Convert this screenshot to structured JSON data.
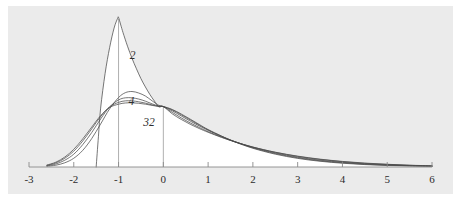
{
  "figure": {
    "background_color": "#ffffff",
    "panel_color": "#ebebeb",
    "fill_color": "#ffffff",
    "curve_color": "#4a4a4a",
    "axis_color": "#8a8a8a",
    "text_color": "#2b2b2b"
  },
  "chart_data": {
    "type": "line",
    "title": "",
    "subtitle": "",
    "xlabel": "",
    "ylabel": "",
    "xlim": [
      -3,
      6
    ],
    "ylim": [
      0,
      1.0
    ],
    "grid": false,
    "legend_position": "inline-annotations",
    "x_ticks": [
      -3,
      -2,
      -1,
      0,
      1,
      2,
      3,
      4,
      5,
      6
    ],
    "x_tick_labels": [
      "-3",
      "-2",
      "-1",
      "0",
      "1",
      "2",
      "3",
      "4",
      "5",
      "6"
    ],
    "y_ticks": [],
    "y_tick_labels": [],
    "annotations": [
      {
        "text": "2",
        "x": -0.75,
        "y": 0.74,
        "style": "italic"
      },
      {
        "text": "4",
        "x": -0.78,
        "y": 0.44,
        "style": "italic"
      },
      {
        "text": "32",
        "x": -0.45,
        "y": 0.3,
        "style": "italic"
      }
    ],
    "reference_lines": [
      {
        "orientation": "vertical",
        "x": -1,
        "y_from": 0,
        "y_to": 0.98
      },
      {
        "orientation": "vertical",
        "x": 0,
        "y_from": 0,
        "y_to": 0.4
      }
    ],
    "series": [
      {
        "name": "2",
        "label": "2",
        "x": [
          -1.5,
          -1.45,
          -1.4,
          -1.3,
          -1.2,
          -1.1,
          -1.02,
          -1.0,
          -0.95,
          -0.9,
          -0.8,
          -0.7,
          -0.6,
          -0.5,
          -0.4,
          -0.3,
          -0.2,
          -0.1,
          0.0,
          0.2,
          0.4,
          0.6,
          0.8,
          1.0,
          1.3,
          1.6,
          2.0,
          2.5,
          3.0,
          3.5,
          4.0,
          4.5,
          5.0,
          5.5,
          6.0
        ],
        "y": [
          0.0,
          0.2,
          0.39,
          0.62,
          0.79,
          0.92,
          0.985,
          0.99,
          0.94,
          0.89,
          0.8,
          0.72,
          0.65,
          0.585,
          0.53,
          0.48,
          0.437,
          0.398,
          0.4,
          0.352,
          0.315,
          0.283,
          0.255,
          0.23,
          0.196,
          0.166,
          0.132,
          0.098,
          0.072,
          0.052,
          0.037,
          0.026,
          0.018,
          0.012,
          0.008
        ]
      },
      {
        "name": "4",
        "label": "4",
        "x": [
          -2.6,
          -2.4,
          -2.2,
          -2.0,
          -1.8,
          -1.6,
          -1.4,
          -1.2,
          -1.0,
          -0.85,
          -0.7,
          -0.55,
          -0.4,
          -0.25,
          -0.1,
          0.0,
          0.2,
          0.4,
          0.6,
          0.8,
          1.0,
          1.3,
          1.6,
          2.0,
          2.5,
          3.0,
          3.5,
          4.0,
          4.5,
          5.0,
          5.5,
          6.0
        ],
        "y": [
          0.005,
          0.012,
          0.028,
          0.058,
          0.11,
          0.188,
          0.285,
          0.385,
          0.46,
          0.492,
          0.5,
          0.49,
          0.47,
          0.438,
          0.408,
          0.4,
          0.362,
          0.325,
          0.292,
          0.262,
          0.234,
          0.198,
          0.167,
          0.132,
          0.097,
          0.07,
          0.05,
          0.035,
          0.024,
          0.017,
          0.011,
          0.007
        ]
      },
      {
        "name": "8",
        "label": "",
        "x": [
          -2.6,
          -2.4,
          -2.2,
          -2.0,
          -1.8,
          -1.6,
          -1.4,
          -1.2,
          -1.0,
          -0.85,
          -0.7,
          -0.55,
          -0.4,
          -0.25,
          -0.1,
          0.0,
          0.2,
          0.4,
          0.6,
          0.8,
          1.0,
          1.3,
          1.6,
          2.0,
          2.5,
          3.0,
          3.5,
          4.0,
          4.5,
          5.0,
          5.5,
          6.0
        ],
        "y": [
          0.008,
          0.02,
          0.045,
          0.085,
          0.148,
          0.228,
          0.318,
          0.398,
          0.444,
          0.458,
          0.458,
          0.45,
          0.436,
          0.418,
          0.404,
          0.4,
          0.372,
          0.338,
          0.304,
          0.272,
          0.242,
          0.202,
          0.168,
          0.13,
          0.093,
          0.065,
          0.045,
          0.031,
          0.021,
          0.014,
          0.009,
          0.006
        ]
      },
      {
        "name": "16",
        "label": "",
        "x": [
          -2.6,
          -2.4,
          -2.2,
          -2.0,
          -1.8,
          -1.6,
          -1.4,
          -1.2,
          -1.0,
          -0.85,
          -0.7,
          -0.55,
          -0.4,
          -0.25,
          -0.1,
          0.0,
          0.2,
          0.4,
          0.6,
          0.8,
          1.0,
          1.3,
          1.6,
          2.0,
          2.5,
          3.0,
          3.5,
          4.0,
          4.5,
          5.0,
          5.5,
          6.0
        ],
        "y": [
          0.011,
          0.027,
          0.058,
          0.105,
          0.172,
          0.252,
          0.334,
          0.398,
          0.428,
          0.438,
          0.438,
          0.432,
          0.423,
          0.411,
          0.402,
          0.4,
          0.378,
          0.346,
          0.312,
          0.278,
          0.246,
          0.204,
          0.167,
          0.127,
          0.089,
          0.061,
          0.041,
          0.028,
          0.018,
          0.012,
          0.008,
          0.005
        ]
      },
      {
        "name": "32",
        "label": "32",
        "x": [
          -2.6,
          -2.4,
          -2.2,
          -2.0,
          -1.8,
          -1.6,
          -1.4,
          -1.2,
          -1.0,
          -0.85,
          -0.7,
          -0.55,
          -0.4,
          -0.25,
          -0.1,
          0.0,
          0.2,
          0.4,
          0.6,
          0.8,
          1.0,
          1.3,
          1.6,
          2.0,
          2.5,
          3.0,
          3.5,
          4.0,
          4.5,
          5.0,
          5.5,
          6.0
        ],
        "y": [
          0.013,
          0.032,
          0.066,
          0.117,
          0.186,
          0.264,
          0.34,
          0.394,
          0.416,
          0.424,
          0.425,
          0.422,
          0.416,
          0.408,
          0.401,
          0.4,
          0.381,
          0.351,
          0.317,
          0.282,
          0.248,
          0.205,
          0.166,
          0.124,
          0.085,
          0.057,
          0.038,
          0.025,
          0.016,
          0.01,
          0.007,
          0.004
        ]
      }
    ]
  }
}
